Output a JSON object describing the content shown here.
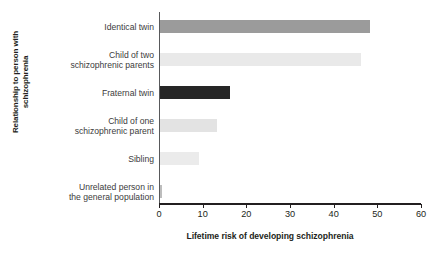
{
  "chart_data": {
    "type": "bar",
    "orientation": "horizontal",
    "title": "",
    "xlabel": "Lifetime risk of developing schizophrenia",
    "ylabel": "Relationship to person with schizophrenia",
    "categories": [
      "Identical twin",
      "Child of two schizophrenic parents",
      "Fraternal twin",
      "Child of one schizophrenic parent",
      "Sibling",
      "Unrelated person in the general population"
    ],
    "category_lines": [
      [
        "Identical twin"
      ],
      [
        "Child of two",
        "schizophrenic parents"
      ],
      [
        "Fraternal twin"
      ],
      [
        "Child of one",
        "schizophrenic parent"
      ],
      [
        "Sibling"
      ],
      [
        "Unrelated person in",
        "the general population"
      ]
    ],
    "values": [
      48,
      46,
      16,
      13,
      9,
      0.5
    ],
    "bar_colors": [
      "#9b9b9b",
      "#e9e9e9",
      "#262626",
      "#e3e3e3",
      "#ebebeb",
      "#bdbdbd"
    ],
    "xlim": [
      0,
      60
    ],
    "xticks": [
      0,
      10,
      20,
      30,
      40,
      50,
      60
    ],
    "xtick_labels": [
      "0",
      "10",
      "20",
      "30",
      "40",
      "50",
      "60"
    ],
    "grid": false,
    "legend": false
  },
  "axis": {
    "x_title": "Lifetime risk of developing schizophrenia",
    "y_title": "Relationship to person with schizophrenia"
  }
}
